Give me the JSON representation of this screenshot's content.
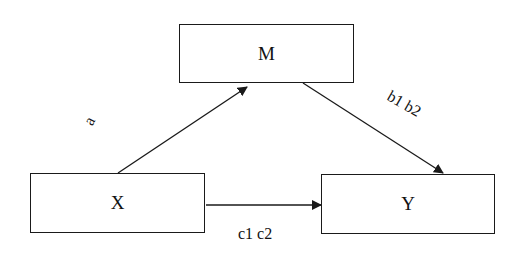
{
  "diagram": {
    "type": "mediation-path-diagram",
    "nodes": [
      {
        "id": "M",
        "label": "M"
      },
      {
        "id": "X",
        "label": "X"
      },
      {
        "id": "Y",
        "label": "Y"
      }
    ],
    "edges": [
      {
        "from": "X",
        "to": "M",
        "label": "a"
      },
      {
        "from": "M",
        "to": "Y",
        "label": "b1 b2"
      },
      {
        "from": "X",
        "to": "Y",
        "label": "c1 c2"
      }
    ],
    "colors": {
      "stroke": "#1a1a1a",
      "background": "#ffffff"
    }
  }
}
